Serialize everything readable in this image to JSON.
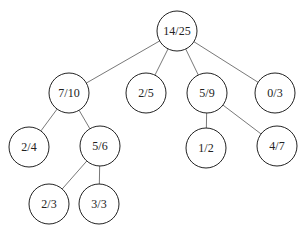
{
  "diagram": {
    "type": "tree",
    "nodes": [
      {
        "id": "n0",
        "label": "14/25",
        "parent": null
      },
      {
        "id": "n1",
        "label": "7/10",
        "parent": "n0"
      },
      {
        "id": "n2",
        "label": "2/5",
        "parent": "n0"
      },
      {
        "id": "n3",
        "label": "5/9",
        "parent": "n0"
      },
      {
        "id": "n4",
        "label": "0/3",
        "parent": "n0"
      },
      {
        "id": "n5",
        "label": "2/4",
        "parent": "n1"
      },
      {
        "id": "n6",
        "label": "5/6",
        "parent": "n1"
      },
      {
        "id": "n7",
        "label": "1/2",
        "parent": "n3"
      },
      {
        "id": "n8",
        "label": "4/7",
        "parent": "n3"
      },
      {
        "id": "n9",
        "label": "2/3",
        "parent": "n6"
      },
      {
        "id": "n10",
        "label": "3/3",
        "parent": "n6"
      }
    ]
  }
}
